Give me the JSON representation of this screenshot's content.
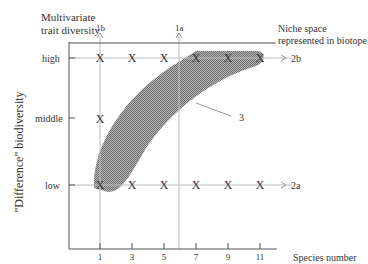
{
  "diagram": {
    "y_axis_title": "\"Difference\" biodiversity",
    "x_axis_title": "\"Number\" biodiversity",
    "top_left_label_line1": "Multivariate",
    "top_left_label_line2": "trait diversity",
    "top_right_label_line1": "Niche space",
    "top_right_label_line2": "represented in biotope",
    "x_axis_end_label": "Species number",
    "y_levels": [
      "high",
      "middle",
      "low"
    ],
    "x_ticks": [
      "1",
      "3",
      "5",
      "7",
      "9",
      "11"
    ],
    "arrow_labels": {
      "vertical_left": "1b",
      "vertical_right": "1a",
      "horizontal_top": "2b",
      "horizontal_bottom": "2a"
    },
    "region_label": "3",
    "marker": "X",
    "markers": [
      {
        "row": "high",
        "x": "1"
      },
      {
        "row": "high",
        "x": "3"
      },
      {
        "row": "high",
        "x": "5"
      },
      {
        "row": "high",
        "x": "7"
      },
      {
        "row": "high",
        "x": "9"
      },
      {
        "row": "high",
        "x": "11"
      },
      {
        "row": "middle",
        "x": "1"
      },
      {
        "row": "low",
        "x": "1"
      },
      {
        "row": "low",
        "x": "3"
      },
      {
        "row": "low",
        "x": "5"
      },
      {
        "row": "low",
        "x": "7"
      },
      {
        "row": "low",
        "x": "9"
      },
      {
        "row": "low",
        "x": "11"
      }
    ],
    "colors": {
      "axis": "#555555",
      "guide": "#aaaaaa",
      "region_fill": "#8a8a8a",
      "text": "#333333"
    }
  }
}
